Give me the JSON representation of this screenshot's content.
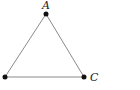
{
  "diagram": {
    "type": "triangle",
    "vertices": [
      {
        "label": "A",
        "x": 46,
        "y": 14
      },
      {
        "label": "",
        "x": 5,
        "y": 77
      },
      {
        "label": "C",
        "x": 84,
        "y": 77
      }
    ],
    "edge_color": "#8a8a8a",
    "point_color": "#111111"
  }
}
